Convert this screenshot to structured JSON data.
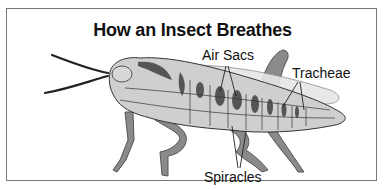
{
  "diagram": {
    "title": "How an Insect Breathes",
    "labels": {
      "air_sacs": "Air Sacs",
      "tracheae": "Tracheae",
      "spiracles": "Spiracles"
    },
    "colors": {
      "body": "#cfcfcf",
      "legs": "#8a8a8a",
      "air_sacs": "#555555",
      "outline": "#333333",
      "wing": "#e6e6e6",
      "border": "#777777"
    }
  }
}
